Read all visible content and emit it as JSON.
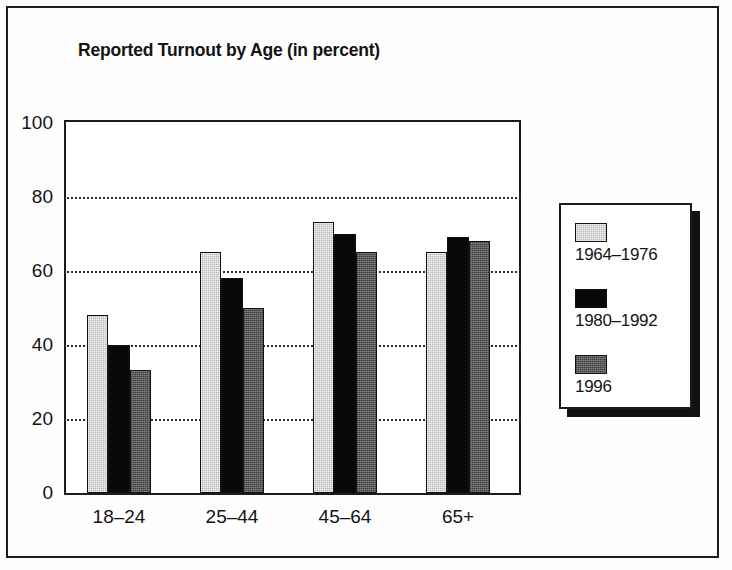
{
  "figure": {
    "background_color": "#fdfdfc",
    "frame_color": "#1c1c1c"
  },
  "chart_data": {
    "type": "bar",
    "title": "Reported Turnout by Age (in percent)",
    "xlabel": "",
    "ylabel": "",
    "ylim": [
      0,
      100
    ],
    "yticks": [
      0,
      20,
      40,
      60,
      80,
      100
    ],
    "grid": true,
    "grid_style": "dotted-horizontal",
    "legend_position": "right-outside",
    "categories": [
      "18–24",
      "25–44",
      "45–64",
      "65+"
    ],
    "series": [
      {
        "name": "1964–1976",
        "color": "#b5b5b5",
        "pattern": "light-stipple",
        "values": [
          48,
          65,
          73,
          65
        ]
      },
      {
        "name": "1980–1992",
        "color": "#080808",
        "pattern": "solid-black",
        "values": [
          40,
          58,
          70,
          69
        ]
      },
      {
        "name": "1996",
        "color": "#595959",
        "pattern": "dark-stipple",
        "values": [
          33,
          50,
          65,
          68
        ]
      }
    ]
  }
}
